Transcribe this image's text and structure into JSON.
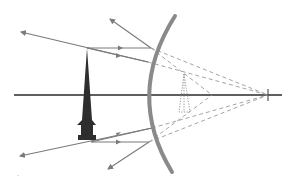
{
  "diagram": {
    "type": "optics-ray-diagram",
    "elements": {
      "principal_axis": {
        "label": "principal axis",
        "color": "#2a2a2a"
      },
      "mirror": {
        "label": "convex mirror",
        "color": "#8a8a8a"
      },
      "object": {
        "label": "object",
        "color": "#2e2e2e"
      },
      "virtual_image": {
        "label": "virtual image",
        "color": "#8a8a8a"
      },
      "focal_point": {
        "label": "focal point",
        "color": "#555555"
      },
      "incident_rays": {
        "label": "incident rays",
        "count": 4,
        "color": "#7a7a7a"
      },
      "reflected_rays": {
        "label": "reflected rays",
        "count": 4,
        "color": "#7a7a7a"
      },
      "virtual_ray_extensions": {
        "label": "dashed extensions",
        "count": 4,
        "color": "#9a9a9a"
      }
    },
    "caption": "·"
  }
}
